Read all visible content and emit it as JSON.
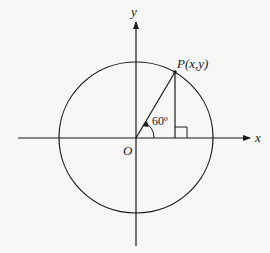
{
  "diagram": {
    "type": "unit-circle",
    "labels": {
      "y_axis": "y",
      "x_axis": "x",
      "origin": "O",
      "point": "P(x,y)",
      "angle": "60º"
    },
    "angle_degrees": 60,
    "colors": {
      "stroke": "#1a1a1a",
      "background": "#f7f7f5"
    }
  }
}
